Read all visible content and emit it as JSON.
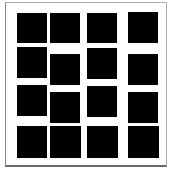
{
  "figure": {
    "square_color": "#000000",
    "background_color": "#ffffff",
    "frame_color": "#8a8a8a",
    "squares": [
      {
        "row": 1,
        "col": 1,
        "x": 17,
        "y": 13,
        "w": 30,
        "h": 30
      },
      {
        "row": 1,
        "col": 2,
        "x": 50,
        "y": 13,
        "w": 30,
        "h": 30
      },
      {
        "row": 1,
        "col": 3,
        "x": 87,
        "y": 13,
        "w": 30,
        "h": 30
      },
      {
        "row": 1,
        "col": 4,
        "x": 128,
        "y": 12,
        "w": 30,
        "h": 31
      },
      {
        "row": 2,
        "col": 1,
        "x": 17,
        "y": 47,
        "w": 30,
        "h": 31
      },
      {
        "row": 2,
        "col": 2,
        "x": 50,
        "y": 54,
        "w": 30,
        "h": 31
      },
      {
        "row": 2,
        "col": 3,
        "x": 87,
        "y": 48,
        "w": 30,
        "h": 31
      },
      {
        "row": 2,
        "col": 4,
        "x": 128,
        "y": 54,
        "w": 30,
        "h": 31
      },
      {
        "row": 3,
        "col": 1,
        "x": 17,
        "y": 85,
        "w": 30,
        "h": 31
      },
      {
        "row": 3,
        "col": 2,
        "x": 50,
        "y": 92,
        "w": 30,
        "h": 31
      },
      {
        "row": 3,
        "col": 3,
        "x": 87,
        "y": 86,
        "w": 30,
        "h": 31
      },
      {
        "row": 3,
        "col": 4,
        "x": 128,
        "y": 92,
        "w": 30,
        "h": 31
      },
      {
        "row": 4,
        "col": 1,
        "x": 17,
        "y": 126,
        "w": 30,
        "h": 32
      },
      {
        "row": 4,
        "col": 2,
        "x": 50,
        "y": 126,
        "w": 31,
        "h": 32
      },
      {
        "row": 4,
        "col": 3,
        "x": 87,
        "y": 126,
        "w": 31,
        "h": 32
      },
      {
        "row": 4,
        "col": 4,
        "x": 128,
        "y": 126,
        "w": 31,
        "h": 32
      }
    ]
  }
}
